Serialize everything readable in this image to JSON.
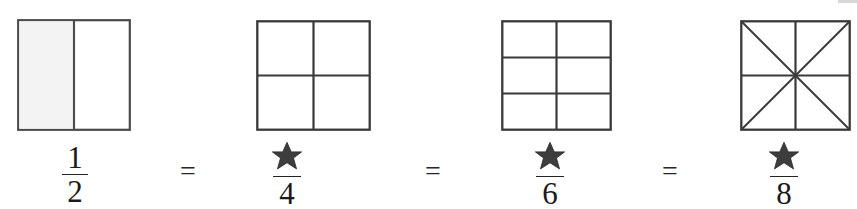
{
  "page": {
    "background_color": "#ffffff",
    "ink_color": "#1a1a1a",
    "line_color": "#333333",
    "shade_color": "#f2f2f2",
    "star_color": "#2b2b2b"
  },
  "equation": {
    "operators": [
      "=",
      "=",
      "="
    ],
    "terms": [
      {
        "numerator": "1",
        "numerator_kind": "digit",
        "denominator": "2",
        "model": {
          "kind": "square-partition",
          "cols": 2,
          "rows": 1,
          "diagonals": false,
          "parts": 2,
          "shaded_parts": 1
        }
      },
      {
        "numerator": "✶",
        "numerator_kind": "star-blank",
        "denominator": "4",
        "model": {
          "kind": "square-partition",
          "cols": 2,
          "rows": 2,
          "diagonals": false,
          "parts": 4,
          "shaded_parts": 0
        }
      },
      {
        "numerator": "✶",
        "numerator_kind": "star-blank",
        "denominator": "6",
        "model": {
          "kind": "square-partition",
          "cols": 2,
          "rows": 3,
          "diagonals": false,
          "parts": 6,
          "shaded_parts": 0
        }
      },
      {
        "numerator": "✶",
        "numerator_kind": "star-blank",
        "denominator": "8",
        "model": {
          "kind": "square-partition",
          "cols": 2,
          "rows": 2,
          "diagonals": true,
          "parts": 8,
          "shaded_parts": 0
        }
      }
    ]
  },
  "layout": {
    "squares": [
      {
        "x": 17,
        "y": 19,
        "w": 114,
        "h": 112
      },
      {
        "x": 256,
        "y": 20,
        "w": 115,
        "h": 111
      },
      {
        "x": 501,
        "y": 20,
        "w": 111,
        "h": 111
      },
      {
        "x": 740,
        "y": 20,
        "w": 111,
        "h": 111
      }
    ],
    "fractions": [
      {
        "x": 48,
        "y": 143,
        "w": 54
      },
      {
        "x": 258,
        "y": 141,
        "w": 58
      },
      {
        "x": 521,
        "y": 141,
        "w": 58
      },
      {
        "x": 755,
        "y": 141,
        "w": 58
      }
    ],
    "operators": [
      {
        "x": 180,
        "y": 157
      },
      {
        "x": 425,
        "y": 157
      },
      {
        "x": 662,
        "y": 157
      }
    ]
  }
}
